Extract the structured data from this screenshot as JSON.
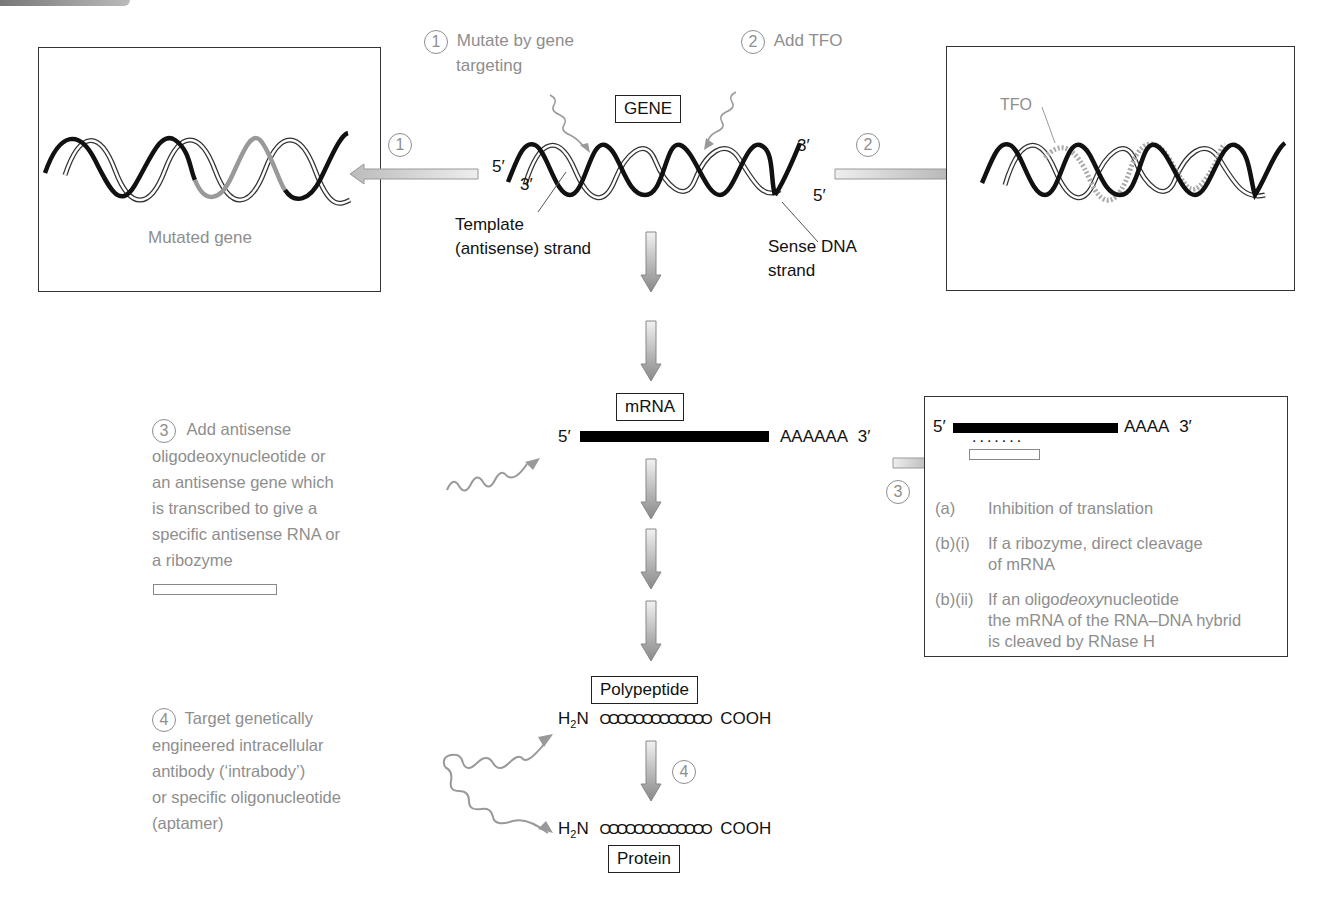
{
  "gene_section": {
    "gene_label": "GENE",
    "five_prime_left": "5′",
    "three_prime_left": "3′",
    "three_prime_right": "3′",
    "five_prime_right": "5′",
    "template_label_line1": "Template",
    "template_label_line2": "(antisense) strand",
    "sense_label_line1": "Sense DNA",
    "sense_label_line2": "strand"
  },
  "strategy_1": {
    "number": "1",
    "text_line1": "Mutate by gene",
    "text_line2": "targeting",
    "arrow_number": "1",
    "box_caption": "Mutated gene"
  },
  "strategy_2": {
    "number": "2",
    "text": "Add TFO",
    "arrow_number": "2",
    "box_tfo_label": "TFO"
  },
  "mrna_section": {
    "label": "mRNA",
    "five_prime": "5′",
    "poly_a": "AAAAAA",
    "three_prime": "3′"
  },
  "strategy_3": {
    "number": "3",
    "lines": [
      "Add antisense",
      "oligodeoxynucleotide or",
      "an antisense gene which",
      "is transcribed to give a",
      "specific antisense RNA or",
      "a ribozyme"
    ],
    "arrow_number": "3",
    "box": {
      "five_prime": "5′",
      "poly_a": "AAAA",
      "three_prime": "3′",
      "dots": ".......",
      "items": [
        {
          "key": "(a)",
          "line1": "Inhibition of translation",
          "line2": ""
        },
        {
          "key": "(b)(i)",
          "line1": "If a ribozyme, direct cleavage",
          "line2": "of mRNA"
        },
        {
          "key": "(b)(ii)",
          "line1_pre": "If an oligo",
          "line1_italic": "deoxy",
          "line1_post": "nucleotide",
          "line2": "the mRNA of the RNA–DNA hybrid",
          "line3": "is cleaved by RNase H"
        }
      ]
    }
  },
  "polypeptide_section": {
    "label": "Polypeptide",
    "n_term": "H",
    "n_sub": "2",
    "n_post": "N",
    "chain": "OOOOOOOOOOOOO",
    "c_term": "COOH"
  },
  "strategy_4": {
    "number": "4",
    "lines": [
      "Target genetically",
      "engineered intracellular",
      "antibody (‘intrabody’)",
      "or specific oligonucleotide",
      "(aptamer)"
    ],
    "arrow_number": "4"
  },
  "protein_section": {
    "label": "Protein",
    "n_term": "H",
    "n_sub": "2",
    "n_post": "N",
    "chain": "OOOOOOOOOOOOO",
    "c_term": "COOH"
  },
  "colors": {
    "annotation_gray": "#8e8e8e",
    "strand_black": "#111111",
    "mutated_gray": "#999999",
    "arrow_gray": "#b5b5b5"
  }
}
